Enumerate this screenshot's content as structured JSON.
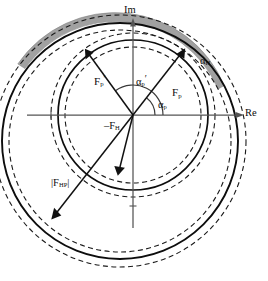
{
  "figure": {
    "type": "complex-plane-phasor-diagram",
    "axes": {
      "imaginary_label": "Im",
      "real_label": "Re",
      "origin_px": [
        133,
        115
      ]
    },
    "labels": {
      "alpha_H": {
        "base": "α",
        "sub": "H",
        "prime": ""
      },
      "F_p_prime": {
        "base": "F",
        "sub": "p",
        "prime": "′"
      },
      "F_p": {
        "base": "F",
        "sub": "p",
        "prime": ""
      },
      "alpha_p_prime": {
        "base": "α",
        "sub": "p",
        "prime": "′"
      },
      "alpha_p": {
        "base": "α",
        "sub": "p",
        "prime": ""
      },
      "minus_F_H": {
        "base": "–F",
        "sub": "H",
        "prime": ""
      },
      "abs_F_HP": {
        "base": "|F",
        "sub": "HP",
        "prime": "|"
      }
    },
    "colors": {
      "stroke": "#0d0d0d",
      "axis": "#4a4a4a",
      "shaded_band": "#9a9a9a",
      "background": "#ffffff"
    },
    "geometry": {
      "inner_circle": {
        "cx": 133,
        "cy": 115,
        "r": 75,
        "style": "solid"
      },
      "inner_dashed_outer": {
        "cx": 133,
        "cy": 115,
        "r": 82,
        "style": "dashed"
      },
      "inner_dashed_inner": {
        "cx": 133,
        "cy": 115,
        "r": 68,
        "style": "dashed"
      },
      "outer_circle": {
        "cx": 120,
        "cy": 141,
        "r": 118,
        "style": "solid"
      },
      "outer_dashed_outer": {
        "cx": 120,
        "cy": 141,
        "r": 126,
        "style": "dashed"
      },
      "outer_dashed_inner": {
        "cx": 120,
        "cy": 141,
        "r": 111,
        "style": "dashed"
      },
      "shaded_band": {
        "start_deg": 28,
        "end_deg": 150,
        "inner_r": 111,
        "outer_r": 120
      }
    },
    "vectors": [
      {
        "name": "F_p_prime",
        "angle_deg": 126,
        "length": 75,
        "arrow": true
      },
      {
        "name": "F_p",
        "angle_deg": 52,
        "length": 78,
        "arrow": true
      },
      {
        "name": "minus_F_H",
        "angle_deg": 256,
        "length": 56,
        "arrow": true
      },
      {
        "name": "abs_F_HP",
        "angle_deg": 232,
        "length": 126,
        "arrow": true
      }
    ],
    "angle_arcs": [
      {
        "name": "alpha_p_prime",
        "from_deg": 0,
        "to_deg": 126,
        "radius": 30
      },
      {
        "name": "alpha_p",
        "from_deg": 0,
        "to_deg": 52,
        "radius": 22
      }
    ]
  }
}
